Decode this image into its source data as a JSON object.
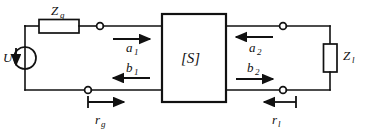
{
  "diagram": {
    "colors": {
      "line": "#111111",
      "background": "#ffffff"
    },
    "source": {
      "symbol_name": "voltage-source",
      "label": "U",
      "arrow_direction": "down"
    },
    "components": [
      {
        "name": "series-impedance",
        "label": "Z",
        "subscript": "g",
        "orientation": "horizontal"
      },
      {
        "name": "load-impedance",
        "label": "Z",
        "subscript": "l",
        "orientation": "vertical"
      }
    ],
    "network_block": {
      "label": "[S]",
      "name": "scattering-matrix-block"
    },
    "waves": [
      {
        "name": "incident-wave-port1",
        "label": "a",
        "subscript": "1",
        "direction": "right"
      },
      {
        "name": "reflected-wave-port1",
        "label": "b",
        "subscript": "1",
        "direction": "left"
      },
      {
        "name": "incident-wave-port2",
        "label": "a",
        "subscript": "2",
        "direction": "left"
      },
      {
        "name": "reflected-wave-port2",
        "label": "b",
        "subscript": "2",
        "direction": "right"
      }
    ],
    "reflection_coefficients": [
      {
        "name": "generator-reflection-coefficient",
        "label": "r",
        "subscript": "g",
        "direction": "right"
      },
      {
        "name": "load-reflection-coefficient",
        "label": "r",
        "subscript": "l",
        "direction": "left"
      }
    ],
    "terminals": [
      {
        "name": "port1-top-terminal"
      },
      {
        "name": "port1-bottom-terminal"
      },
      {
        "name": "port2-top-terminal"
      },
      {
        "name": "port2-bottom-terminal"
      }
    ]
  }
}
